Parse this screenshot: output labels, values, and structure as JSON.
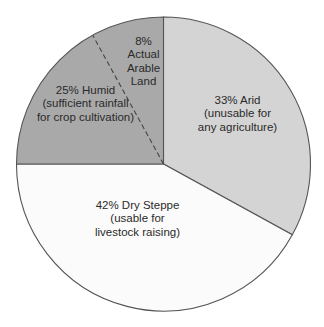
{
  "chart_data": {
    "type": "pie",
    "title": "",
    "slices": [
      {
        "name": "Arid",
        "value": 33,
        "color": "#d4d4d4",
        "label_lines": [
          "33% Arid",
          "(unusable for",
          "any agriculture)"
        ]
      },
      {
        "name": "Dry Steppe",
        "value": 42,
        "color": "#fbfbfb",
        "label_lines": [
          "42% Dry Steppe",
          "(usable for",
          "livestock raising)"
        ]
      },
      {
        "name": "Humid",
        "value": 25,
        "color": "#a9a9a9",
        "label_lines": [
          "25% Humid",
          "(sufficient rainfall",
          "for crop cultivation)"
        ]
      }
    ],
    "sub_slice": {
      "name": "Actual Arable Land",
      "value": 8,
      "within": "Humid",
      "boundary_style": "dashed",
      "label_lines": [
        "8%",
        "Actual",
        "Arable",
        "Land"
      ]
    },
    "start_angle": "top",
    "direction": "clockwise",
    "stroke_color": "#555555"
  }
}
